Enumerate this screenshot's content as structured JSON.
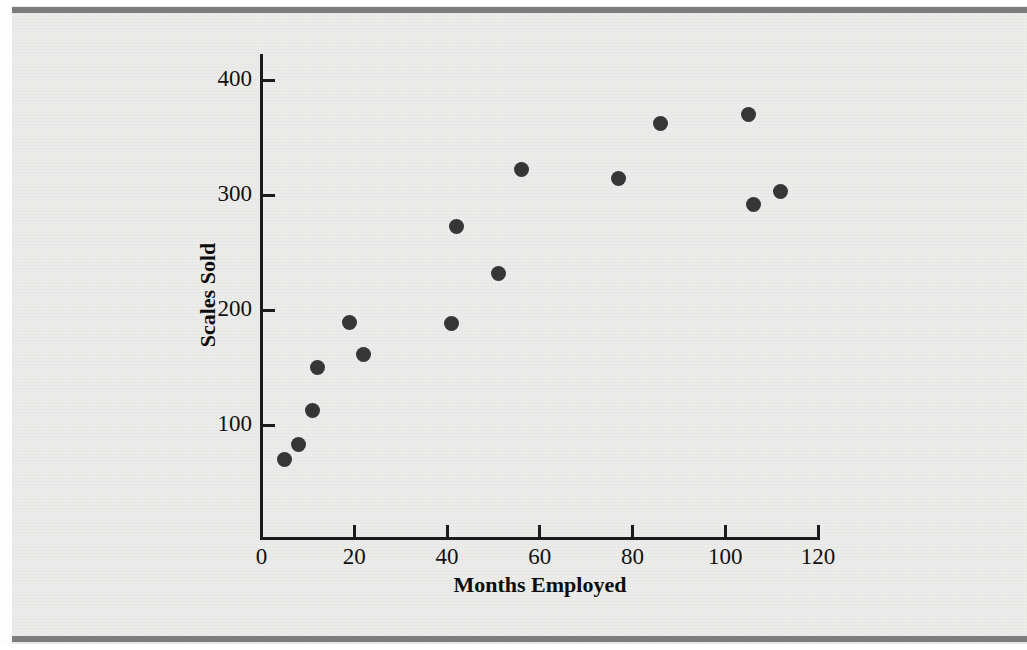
{
  "figure": {
    "background_color": "#ececeb",
    "rule_color": "#7c7c7c",
    "marker_color": "#363636",
    "axis_color": "#1b1b1b"
  },
  "chart_data": {
    "type": "scatter",
    "title": "",
    "xlabel": "Months Employed",
    "ylabel": "Scales Sold",
    "xlim": [
      0,
      126
    ],
    "ylim": [
      0,
      420
    ],
    "xticks": [
      0,
      20,
      40,
      60,
      80,
      100,
      120
    ],
    "yticks": [
      100,
      200,
      300,
      400
    ],
    "xtick_labels": [
      "0",
      "20",
      "40",
      "60",
      "80",
      "100",
      "120"
    ],
    "ytick_labels": [
      "100",
      "200",
      "300",
      "400"
    ],
    "grid": false,
    "legend": null,
    "series": [
      {
        "name": "Salesperson",
        "marker": "filled-circle",
        "points": [
          {
            "x": 5,
            "y": 70
          },
          {
            "x": 8,
            "y": 83
          },
          {
            "x": 11,
            "y": 113
          },
          {
            "x": 12,
            "y": 150
          },
          {
            "x": 19,
            "y": 189
          },
          {
            "x": 22,
            "y": 161
          },
          {
            "x": 41,
            "y": 188
          },
          {
            "x": 42,
            "y": 273
          },
          {
            "x": 51,
            "y": 232
          },
          {
            "x": 56,
            "y": 322
          },
          {
            "x": 77,
            "y": 314
          },
          {
            "x": 86,
            "y": 362
          },
          {
            "x": 105,
            "y": 370
          },
          {
            "x": 106,
            "y": 292
          },
          {
            "x": 112,
            "y": 303
          }
        ]
      }
    ]
  }
}
